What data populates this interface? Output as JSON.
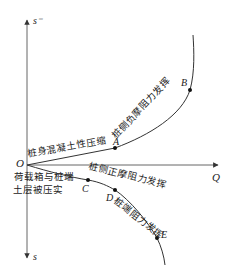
{
  "axes": {
    "vertical_top_label": "s⁻",
    "vertical_bottom_label": "s",
    "horizontal_label": "Q",
    "origin_label": "O"
  },
  "points": {
    "A": "A",
    "B": "B",
    "C": "C",
    "D": "D",
    "E": "E"
  },
  "annotations": {
    "OA": "桩身混凝土性压缩",
    "AB": "桩侧负摩阻力发挥",
    "origin_note_line1": "荷载箱与桩端",
    "origin_note_line2": "土层被压实",
    "CD": "桩侧正摩阻力发挥",
    "DE": "桩端阻力发挥"
  },
  "colors": {
    "line": "#333333",
    "axis": "#555555",
    "text": "#222222"
  }
}
